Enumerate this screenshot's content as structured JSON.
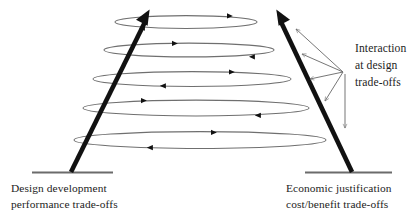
{
  "diagram": {
    "title": "Interaction at design trade-offs",
    "background_color": "#ffffff",
    "axes": {
      "left": {
        "label_line1": "Design development",
        "label_line2": "performance trade-offs",
        "arrow_direction": "up-right",
        "color": "#111111"
      },
      "right": {
        "label_line1": "Economic justification",
        "label_line2": "cost/benefit trade-offs",
        "arrow_direction": "up-left",
        "color": "#111111"
      }
    },
    "baselines": {
      "color": "#6b6b6b",
      "left_label": "left-baseline",
      "right_label": "right-baseline"
    },
    "loops": {
      "count": 5,
      "stroke_color": "#6f6f6f",
      "arrowhead_color": "#111111",
      "top_arrow_direction": "right",
      "bottom_arrow_direction": "left",
      "items": [
        {
          "name": "loop-1",
          "cy": 22,
          "rx": 71,
          "ry": 6.5,
          "cx": 186
        },
        {
          "name": "loop-2",
          "cy": 50,
          "rx": 85,
          "ry": 7.0,
          "cx": 189
        },
        {
          "name": "loop-3",
          "cy": 79,
          "rx": 99,
          "ry": 7.5,
          "cx": 192
        },
        {
          "name": "loop-4",
          "cy": 108,
          "rx": 113,
          "ry": 8.0,
          "cx": 196
        },
        {
          "name": "loop-5",
          "cy": 140,
          "rx": 126,
          "ry": 8.5,
          "cx": 200
        }
      ]
    },
    "annotation": {
      "line1": "Interaction",
      "line2": "at design",
      "line3": "trade-offs",
      "leader_color": "#6f6f6f",
      "leader_count": 4,
      "leader_origin_x": 343,
      "leader_origin_y": 72
    }
  }
}
